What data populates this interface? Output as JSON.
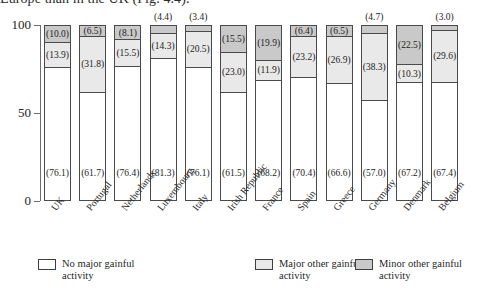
{
  "top_caption": "Europe than in the UK (Fig. 4.4).",
  "chart_data": {
    "type": "bar",
    "subtype": "stacked-bar-100",
    "title": "",
    "xlabel": "",
    "ylabel": "",
    "ylim": [
      0,
      100
    ],
    "yticks": [
      "0",
      "50",
      "100"
    ],
    "grid": false,
    "legend_position": "bottom",
    "categories": [
      "UK",
      "Portugal",
      "Netherlands",
      "Luxembourg",
      "Italy",
      "Irish Republic",
      "France",
      "Spain",
      "Greece",
      "Germany",
      "Denmark",
      "Belgium"
    ],
    "series": [
      {
        "name": "No major gainful activity",
        "color": "#ffffff",
        "values": [
          76.1,
          61.7,
          76.4,
          81.3,
          76.1,
          61.5,
          68.2,
          70.4,
          66.6,
          57.0,
          67.2,
          67.4
        ]
      },
      {
        "name": "Major other gainful activity",
        "color": "#e9e9e9",
        "values": [
          13.9,
          31.8,
          15.5,
          14.3,
          20.5,
          23.0,
          11.9,
          23.2,
          26.9,
          38.3,
          10.3,
          29.6
        ]
      },
      {
        "name": "Minor other gainful activity",
        "color": "#c9c9c9",
        "values": [
          10.0,
          6.5,
          8.1,
          4.4,
          3.4,
          15.5,
          19.9,
          6.4,
          6.5,
          4.7,
          22.5,
          3.0
        ]
      }
    ],
    "value_label_format": "(v)",
    "labels_outside": {
      "Luxembourg": "(4.4)",
      "Italy": "(3.4)",
      "Germany": "(4.7)",
      "Belgium": "(3.0)"
    }
  },
  "legend": {
    "items": [
      {
        "label": "No major gainful activity",
        "swatch": "none"
      },
      {
        "label": "Major other gainful activity",
        "swatch": "major"
      },
      {
        "label": "Minor other gainful activity",
        "swatch": "minor"
      }
    ]
  }
}
